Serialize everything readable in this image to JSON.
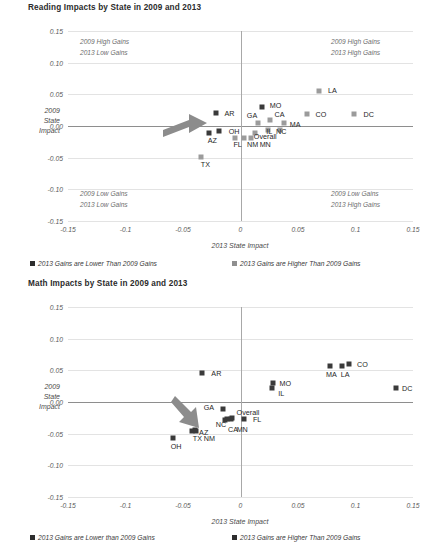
{
  "page": {
    "width": 437,
    "height": 553,
    "background": "#ffffff"
  },
  "colors": {
    "lower_marker": "#3a3a3a",
    "higher_marker": "#9b9b9b",
    "gridline": "#e3e3e3",
    "axis": "#8e8e8e",
    "text": "#3f3f3f",
    "arrow": "#8c8c8c"
  },
  "charts": [
    {
      "id": "reading",
      "title": "Reading Impacts by State in 2009 and 2013",
      "chart_data": {
        "type": "scatter",
        "title": "Reading Impacts by State in 2009 and 2013",
        "xlabel": "2013 State Impact",
        "ylabel": "2009 State Impact",
        "xlim": [
          -0.15,
          0.15
        ],
        "ylim": [
          -0.15,
          0.15
        ],
        "xticks": [
          "-0.15",
          "-0.1",
          "-0.05",
          "0",
          "0.05",
          "0.1",
          "0.15"
        ],
        "xtick_values": [
          -0.15,
          -0.1,
          -0.05,
          0,
          0.05,
          0.1,
          0.15
        ],
        "yticks": [
          "0.15",
          "0.10",
          "0.05",
          "0.00",
          "-0.05",
          "-0.10",
          "-0.15"
        ],
        "ytick_values": [
          0.15,
          0.1,
          0.05,
          0,
          -0.05,
          -0.1,
          -0.15
        ],
        "grid": true,
        "legend_position": "bottom",
        "series": [
          {
            "name": "2013 Gains are Lower Than 2009 Gains",
            "color": "#3a3a3a",
            "points": [
              {
                "label": "AR",
                "x": -0.0215,
                "y": 0.0205,
                "lx": -0.0095,
                "ly": 0.0205
              },
              {
                "label": "MO",
                "x": 0.0185,
                "y": 0.0305,
                "lx": 0.0305,
                "ly": 0.0325
              },
              {
                "label": "AZ",
                "x": -0.0275,
                "y": -0.011,
                "lx": -0.0245,
                "ly": -0.0215
              },
              {
                "label": "OH",
                "x": -0.0185,
                "y": -0.0075,
                "lx": -0.0055,
                "ly": -0.008
              }
            ]
          },
          {
            "name": "2013 Gains are Higher Than 2009 Gains",
            "color": "#9b9b9b",
            "points": [
              {
                "label": "LA",
                "x": 0.068,
                "y": 0.056,
                "lx": 0.08,
                "ly": 0.0565
              },
              {
                "label": "CO",
                "x": 0.0575,
                "y": 0.0195,
                "lx": 0.07,
                "ly": 0.0195
              },
              {
                "label": "DC",
                "x": 0.099,
                "y": 0.019,
                "lx": 0.1115,
                "ly": 0.019
              },
              {
                "label": "GA",
                "x": 0.0155,
                "y": 0.0055,
                "lx": 0.01,
                "ly": 0.018
              },
              {
                "label": "CA",
                "x": 0.0255,
                "y": 0.009,
                "lx": 0.034,
                "ly": 0.0185
              },
              {
                "label": "MA",
                "x": 0.0375,
                "y": 0.0055,
                "lx": 0.0475,
                "ly": 0.003
              },
              {
                "label": "IL",
                "x": 0.0235,
                "y": -0.006,
                "lx": 0.025,
                "ly": -0.0085
              },
              {
                "label": "NC",
                "x": 0.034,
                "y": -0.0065,
                "lx": 0.0355,
                "ly": -0.0085
              },
              {
                "label": "Overall",
                "x": 0.0125,
                "y": -0.011,
                "lx": 0.0215,
                "ly": -0.0165
              },
              {
                "label": "FL",
                "x": -0.005,
                "y": -0.0185,
                "lx": -0.0025,
                "ly": -0.029
              },
              {
                "label": "NM",
                "x": 0.003,
                "y": -0.0185,
                "lx": 0.0105,
                "ly": -0.029
              },
              {
                "label": "MN",
                "x": 0.009,
                "y": -0.019,
                "lx": 0.0215,
                "ly": -0.029
              },
              {
                "label": "TX",
                "x": -0.0345,
                "y": -0.049,
                "lx": -0.0305,
                "ly": -0.06
              }
            ]
          }
        ],
        "quadrant_notes": [
          {
            "position": "top-left",
            "lines": [
              "2009 High Gains",
              "2013 Low Gains"
            ]
          },
          {
            "position": "top-right",
            "lines": [
              "2009 High Gains",
              "2013 High Gains"
            ]
          },
          {
            "position": "bottom-left",
            "lines": [
              "2009 Low Gains",
              "2013 Low Gains"
            ]
          },
          {
            "position": "bottom-right",
            "lines": [
              "2009 Low Gains",
              "2013 High Gains"
            ]
          }
        ],
        "annotations": [
          {
            "type": "arrow",
            "points_to": {
              "x": -0.0275,
              "y": -0.011
            },
            "direction": "right"
          }
        ]
      },
      "legend": [
        {
          "label": "2013 Gains are Lower Than 2009 Gains",
          "swatch": "lower"
        },
        {
          "label": "2013 Gains are Higher Than 2009 Gains",
          "swatch": "higher"
        }
      ]
    },
    {
      "id": "math",
      "title": "Math Impacts by State in 2009 and 2013",
      "chart_data": {
        "type": "scatter",
        "title": "Math Impacts by State in 2009 and 2013",
        "xlabel": "2013 State Impact",
        "ylabel": "2009 State Impact",
        "xlim": [
          -0.15,
          0.15
        ],
        "ylim": [
          -0.15,
          0.15
        ],
        "xticks": [
          "-0.15",
          "-0.1",
          "-0.05",
          "0",
          "0.05",
          "0.1",
          "0.15"
        ],
        "xtick_values": [
          -0.15,
          -0.1,
          -0.05,
          0,
          0.05,
          0.1,
          0.15
        ],
        "yticks": [
          "0.15",
          "0.10",
          "0.05",
          "0.00",
          "-0.05",
          "-0.10",
          "-0.15"
        ],
        "ytick_values": [
          0.15,
          0.1,
          0.05,
          0,
          -0.05,
          -0.1,
          -0.15
        ],
        "grid": true,
        "legend_position": "bottom",
        "series": [
          {
            "name": "2013 Gains are Lower than 2009 Gains",
            "color": "#3a3a3a",
            "points": [
              {
                "label": "AR",
                "x": -0.0335,
                "y": 0.0455,
                "lx": -0.021,
                "ly": 0.0455
              },
              {
                "label": "GA",
                "x": -0.0155,
                "y": -0.0105,
                "lx": -0.0275,
                "ly": -0.0075
              },
              {
                "label": "Overall",
                "x": -0.0075,
                "y": -0.025,
                "lx": 0.0065,
                "ly": -0.0165
              },
              {
                "label": "FL",
                "x": 0.003,
                "y": -0.0265,
                "lx": 0.0145,
                "ly": -0.0265
              },
              {
                "label": "CA",
                "x": -0.0115,
                "y": -0.0275,
                "lx": -0.0065,
                "ly": -0.042
              },
              {
                "label": "MN",
                "x": -0.0085,
                "y": -0.0275,
                "lx": 0.0015,
                "ly": -0.042
              },
              {
                "label": "NC",
                "x": -0.0135,
                "y": -0.028,
                "lx": -0.017,
                "ly": -0.0355
              },
              {
                "label": "AZ",
                "x": -0.04,
                "y": -0.0445,
                "lx": -0.032,
                "ly": -0.047
              },
              {
                "label": "TX",
                "x": -0.042,
                "y": -0.0455,
                "lx": -0.0375,
                "ly": -0.0565
              },
              {
                "label": "NM",
                "x": -0.039,
                "y": -0.046,
                "lx": -0.027,
                "ly": -0.0565
              },
              {
                "label": "OH",
                "x": -0.059,
                "y": -0.0575,
                "lx": -0.056,
                "ly": -0.069
              },
              {
                "label": "IL",
                "x": 0.027,
                "y": 0.022,
                "lx": 0.0355,
                "ly": 0.0145
              },
              {
                "label": "MO",
                "x": 0.0285,
                "y": 0.0305,
                "lx": 0.039,
                "ly": 0.0305
              },
              {
                "label": "MA",
                "x": 0.0775,
                "y": 0.0565,
                "lx": 0.079,
                "ly": 0.0445
              },
              {
                "label": "LA",
                "x": 0.088,
                "y": 0.057,
                "lx": 0.091,
                "ly": 0.0445
              },
              {
                "label": "CO",
                "x": 0.0945,
                "y": 0.06,
                "lx": 0.106,
                "ly": 0.06
              },
              {
                "label": "DC",
                "x": 0.1355,
                "y": 0.022,
                "lx": 0.145,
                "ly": 0.022
              }
            ]
          }
        ],
        "quadrant_notes": [],
        "annotations": [
          {
            "type": "arrow",
            "points_to": {
              "x": -0.04,
              "y": -0.0445
            },
            "direction": "down-right"
          }
        ]
      },
      "legend": [
        {
          "label": "2013 Gains are Lower than 2009 Gains",
          "swatch": "lower"
        },
        {
          "label": "2013 Gains are Higher Than 2009 Gains",
          "swatch": "higher"
        }
      ]
    }
  ]
}
